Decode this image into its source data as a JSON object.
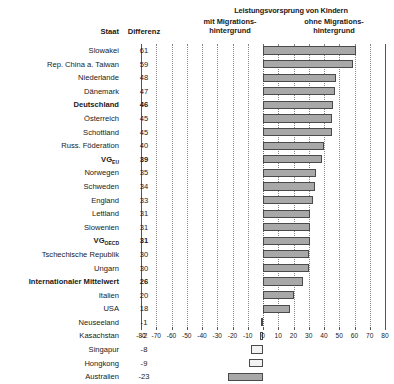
{
  "header": {
    "main_title": "Leistungsvorsprung von Kindern",
    "left_group_line1": "mit Migrations-",
    "left_group_line2": "hintergrund",
    "right_group_line1": "ohne Migrations-",
    "right_group_line2": "hintergrund",
    "col_state": "Staat",
    "col_difference": "Differenz"
  },
  "chart_data": {
    "type": "bar",
    "orientation": "horizontal",
    "title": "Leistungsvorsprung von Kindern",
    "xlabel": "",
    "ylabel": "",
    "xlim": [
      -80,
      80
    ],
    "xticks": [
      -80,
      -70,
      -60,
      -50,
      -40,
      -30,
      -20,
      -10,
      0,
      10,
      20,
      30,
      40,
      50,
      60,
      70,
      80
    ],
    "grid": true,
    "legend": [
      "mit Migrationshintergrund",
      "ohne Migrationshintergrund"
    ],
    "categories": [
      "Slowakei",
      "Rep. China a. Taiwan",
      "Niederlande",
      "Dänemark",
      "Deutschland",
      "Österreich",
      "Schottland",
      "Russ. Föderation",
      "VG EU",
      "Norwegen",
      "Schweden",
      "England",
      "Lettland",
      "Slowenien",
      "VG OECD",
      "Tschechische Republik",
      "Ungarn",
      "Internationaler Mittelwert",
      "Italien",
      "USA",
      "Neuseeland",
      "Kasachstan",
      "Singapur",
      "Hongkong",
      "Australien"
    ],
    "values": [
      61,
      59,
      48,
      47,
      46,
      45,
      45,
      40,
      39,
      35,
      34,
      33,
      31,
      31,
      31,
      30,
      30,
      26,
      20,
      18,
      -1,
      -2,
      -8,
      -9,
      -23
    ]
  },
  "rows": [
    {
      "name": "Slowakei",
      "sub": "",
      "value": 61,
      "bold": false,
      "light": false
    },
    {
      "name": "Rep. China a. Taiwan",
      "sub": "",
      "value": 59,
      "bold": false,
      "light": false
    },
    {
      "name": "Niederlande",
      "sub": "",
      "value": 48,
      "bold": false,
      "light": false
    },
    {
      "name": "Dänemark",
      "sub": "",
      "value": 47,
      "bold": false,
      "light": false
    },
    {
      "name": "Deutschland",
      "sub": "",
      "value": 46,
      "bold": true,
      "light": false
    },
    {
      "name": "Österreich",
      "sub": "",
      "value": 45,
      "bold": false,
      "light": false
    },
    {
      "name": "Schottland",
      "sub": "",
      "value": 45,
      "bold": false,
      "light": false
    },
    {
      "name": "Russ. Föderation",
      "sub": "",
      "value": 40,
      "bold": false,
      "light": false
    },
    {
      "name": "VG",
      "sub": "EU",
      "value": 39,
      "bold": true,
      "light": false
    },
    {
      "name": "Norwegen",
      "sub": "",
      "value": 35,
      "bold": false,
      "light": false
    },
    {
      "name": "Schweden",
      "sub": "",
      "value": 34,
      "bold": false,
      "light": false
    },
    {
      "name": "England",
      "sub": "",
      "value": 33,
      "bold": false,
      "light": false
    },
    {
      "name": "Lettland",
      "sub": "",
      "value": 31,
      "bold": false,
      "light": false
    },
    {
      "name": "Slowenien",
      "sub": "",
      "value": 31,
      "bold": false,
      "light": false
    },
    {
      "name": "VG",
      "sub": "OECD",
      "value": 31,
      "bold": true,
      "light": false
    },
    {
      "name": "Tschechische Republik",
      "sub": "",
      "value": 30,
      "bold": false,
      "light": false
    },
    {
      "name": "Ungarn",
      "sub": "",
      "value": 30,
      "bold": false,
      "light": false
    },
    {
      "name": "Internationaler Mittelwert",
      "sub": "",
      "value": 26,
      "bold": true,
      "light": false
    },
    {
      "name": "Italien",
      "sub": "",
      "value": 20,
      "bold": false,
      "light": false
    },
    {
      "name": "USA",
      "sub": "",
      "value": 18,
      "bold": false,
      "light": false
    },
    {
      "name": "Neuseeland",
      "sub": "",
      "value": -1,
      "bold": false,
      "light": true
    },
    {
      "name": "Kasachstan",
      "sub": "",
      "value": -2,
      "bold": false,
      "light": true
    },
    {
      "name": "Singapur",
      "sub": "",
      "value": -8,
      "bold": false,
      "light": true
    },
    {
      "name": "Hongkong",
      "sub": "",
      "value": -9,
      "bold": false,
      "light": true
    },
    {
      "name": "Australien",
      "sub": "",
      "value": -23,
      "bold": false,
      "light": false
    }
  ]
}
